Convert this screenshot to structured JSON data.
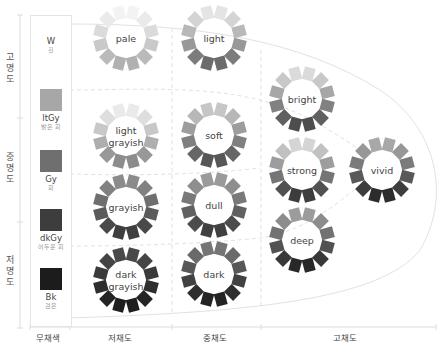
{
  "lightness_axis": {
    "labels": [
      "고명도",
      "중명도",
      "저명도"
    ]
  },
  "chroma_axis": {
    "labels": [
      "무채색",
      "저채도",
      "중채도",
      "고채도"
    ]
  },
  "achromatic": [
    {
      "code": "W",
      "name": "흰",
      "color": "#ffffff"
    },
    {
      "code": "ltGy",
      "name": "밝은 회",
      "color": "#a7a7a7"
    },
    {
      "code": "Gy",
      "name": "회",
      "color": "#6f6f6f"
    },
    {
      "code": "dkGy",
      "name": "어두운 회",
      "color": "#3d3d3d"
    },
    {
      "code": "Bk",
      "name": "검은",
      "color": "#1c1c1c"
    }
  ],
  "tones": [
    {
      "id": "pale",
      "label_lines": [
        "pale"
      ],
      "group": "저채도",
      "top_shade": "#f4f4f4",
      "bottom_shade": "#b0b0b0"
    },
    {
      "id": "light-grayish",
      "label_lines": [
        "light",
        "grayish"
      ],
      "group": "저채도",
      "top_shade": "#ececec",
      "bottom_shade": "#8a8a8a"
    },
    {
      "id": "grayish",
      "label_lines": [
        "grayish"
      ],
      "group": "저채도",
      "top_shade": "#8c8c8c",
      "bottom_shade": "#3e3e3e"
    },
    {
      "id": "dark-grayish",
      "label_lines": [
        "dark",
        "grayish"
      ],
      "group": "저채도",
      "top_shade": "#4a4a4a",
      "bottom_shade": "#1e1e1e"
    },
    {
      "id": "light",
      "label_lines": [
        "light"
      ],
      "group": "중채도",
      "top_shade": "#e6e6e6",
      "bottom_shade": "#6a6a6a"
    },
    {
      "id": "soft",
      "label_lines": [
        "soft"
      ],
      "group": "중채도",
      "top_shade": "#c8c8c8",
      "bottom_shade": "#555555"
    },
    {
      "id": "dull",
      "label_lines": [
        "dull"
      ],
      "group": "중채도",
      "top_shade": "#9c9c9c",
      "bottom_shade": "#3e3e3e"
    },
    {
      "id": "dark",
      "label_lines": [
        "dark"
      ],
      "group": "중채도",
      "top_shade": "#767676",
      "bottom_shade": "#222222"
    },
    {
      "id": "bright",
      "label_lines": [
        "bright"
      ],
      "group": "고채도",
      "top_shade": "#dedede",
      "bottom_shade": "#4a4a4a"
    },
    {
      "id": "strong",
      "label_lines": [
        "strong"
      ],
      "group": "고채도",
      "top_shade": "#d8d8d8",
      "bottom_shade": "#3a3a3a"
    },
    {
      "id": "deep",
      "label_lines": [
        "deep"
      ],
      "group": "고채도",
      "top_shade": "#9e9e9e",
      "bottom_shade": "#262626"
    },
    {
      "id": "vivid",
      "label_lines": [
        "vivid"
      ],
      "group": "고채도",
      "top_shade": "#aaaaaa",
      "bottom_shade": "#2a2a2a"
    }
  ]
}
